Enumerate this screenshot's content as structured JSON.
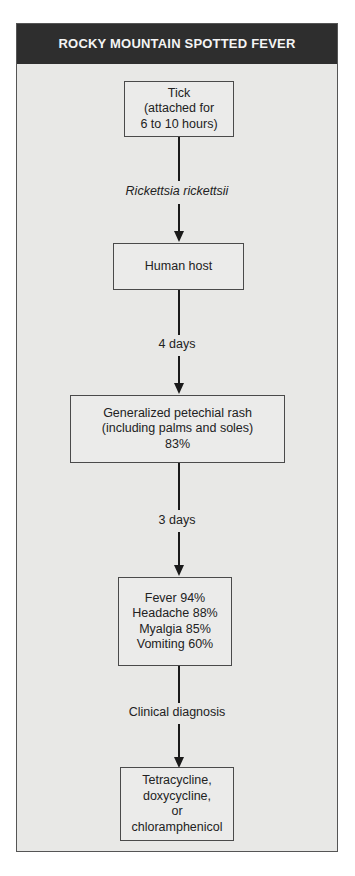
{
  "title": "ROCKY MOUNTAIN SPOTTED FEVER",
  "nodes": {
    "tick": [
      "Tick",
      "(attached for",
      "6 to 10 hours)"
    ],
    "host": [
      "Human host"
    ],
    "rash": [
      "Generalized petechial rash",
      "(including palms and soles)",
      "83%"
    ],
    "symptoms": [
      "Fever 94%",
      "Headache 88%",
      "Myalgia 85%",
      "Vomiting 60%"
    ],
    "treatment": [
      "Tetracycline,",
      "doxycycline,",
      "or",
      "chloramphenicol"
    ]
  },
  "edges": {
    "tick_to_host": "Rickettsia rickettsii",
    "host_to_rash": "4 days",
    "rash_to_symptoms": "3 days",
    "symptoms_to_treatment": "Clinical diagnosis"
  }
}
